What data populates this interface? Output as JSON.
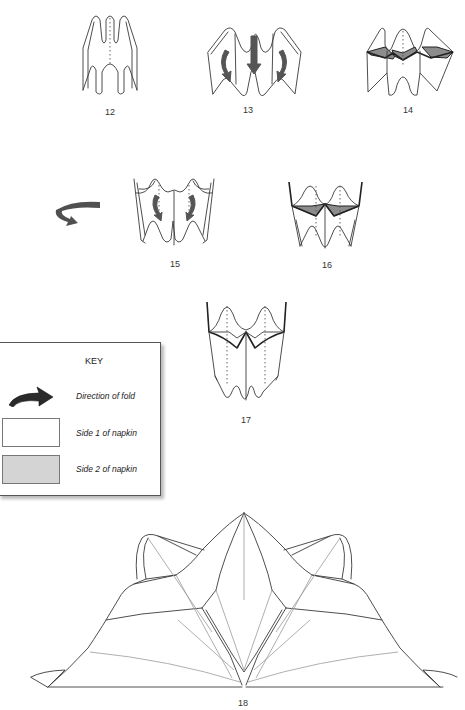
{
  "diagram": {
    "type": "napkin folding instructions",
    "steps": [
      {
        "number": "12",
        "description": "Pleated napkin, three peaks with center dashed fold line"
      },
      {
        "number": "13",
        "description": "Fold arrows: side peaks fold outward/down, center arrow points down"
      },
      {
        "number": "14",
        "description": "Top edges folded down showing shaded side 2 triangles"
      },
      {
        "number": "15",
        "description": "Turn over; curved arrows fold inner flaps"
      },
      {
        "number": "16",
        "description": "Two peaks with shaded triangles at the waist"
      },
      {
        "number": "17",
        "description": "Two peaks, top edges folded down, dashed center lines"
      },
      {
        "number": "18",
        "description": "Finished napkin fold, opened into fan/lotus shape"
      }
    ],
    "turn_over_arrow": "turn-over-arrow-icon"
  },
  "key": {
    "title": "KEY",
    "items": [
      {
        "icon": "fold-direction-arrow-icon",
        "label": "Direction of fold"
      },
      {
        "swatch_color": "#ffffff",
        "label": "Side 1 of napkin"
      },
      {
        "swatch_color": "#d4d4d4",
        "label": "Side 2 of napkin"
      }
    ]
  },
  "colors": {
    "line": "#3a3a3a",
    "arrow": "#555555",
    "shade_side2": "#8c8c8c",
    "swatch_side2": "#d4d4d4",
    "background": "#ffffff"
  }
}
